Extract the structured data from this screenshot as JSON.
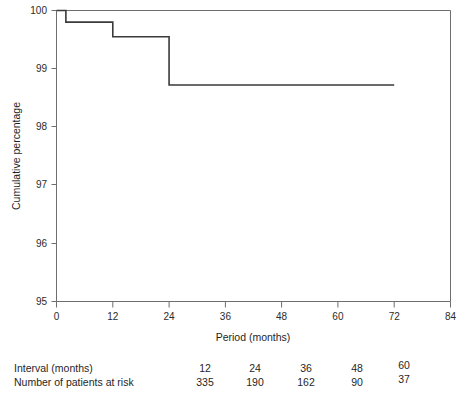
{
  "chart_data": {
    "type": "line",
    "subtype": "kaplan-meier-step",
    "title": "",
    "xlabel": "Period (months)",
    "ylabel": "Cumulative percentage",
    "xlim": [
      0,
      84
    ],
    "ylim": [
      95,
      100
    ],
    "xticks": [
      0,
      12,
      24,
      36,
      48,
      60,
      72,
      84
    ],
    "xtick_labels": [
      "0",
      "12",
      "24",
      "36",
      "48",
      "60",
      "72",
      "84"
    ],
    "yticks": [
      95,
      96,
      97,
      98,
      99,
      100
    ],
    "ytick_labels": [
      "95",
      "96",
      "97",
      "98",
      "99",
      "100"
    ],
    "grid": false,
    "legend": null,
    "series": [
      {
        "name": "Cumulative percentage",
        "x": [
          0,
          2,
          2,
          12,
          12,
          24,
          24,
          72
        ],
        "y": [
          100.0,
          100.0,
          99.8,
          99.8,
          99.55,
          99.55,
          98.72,
          98.72
        ],
        "step_points": [
          {
            "x": 0,
            "y": 100.0
          },
          {
            "x": 2,
            "y": 99.8
          },
          {
            "x": 12,
            "y": 99.55
          },
          {
            "x": 24,
            "y": 98.72
          },
          {
            "x": 72,
            "y": 98.72
          }
        ]
      }
    ],
    "risk_table": {
      "rows": [
        {
          "label": "Interval (months)",
          "values": [
            "12",
            "24",
            "36",
            "48",
            "60"
          ]
        },
        {
          "label": "Number of patients at risk",
          "values": [
            "335",
            "190",
            "162",
            "90",
            "37"
          ]
        }
      ]
    }
  },
  "axes": {
    "x_title": "Period (months)",
    "y_title": "Cumulative percentage"
  },
  "colors": {
    "line": "#3a3a3a",
    "axis": "#6e6e6e",
    "text": "#1f1f1f",
    "background": "#ffffff"
  }
}
